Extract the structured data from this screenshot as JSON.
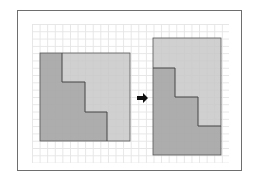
{
  "diagram": {
    "colors": {
      "frame": "#6e6e6e",
      "grid": "#e6e6e6",
      "dark_piece": "#a9a9a9",
      "light_piece": "#c8c8c8",
      "outline": "#555555",
      "arrow": "#111111"
    },
    "left_figure": {
      "label": "square",
      "x": 40,
      "y": 53,
      "w": 90,
      "h": 88
    },
    "right_figure": {
      "label": "rectangle",
      "x": 153,
      "y": 38,
      "w": 68,
      "h": 117
    },
    "arrow": {
      "symbol": "➔"
    }
  }
}
